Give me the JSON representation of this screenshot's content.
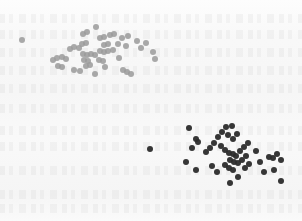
{
  "figure": {
    "background_color": "#f7f7f7",
    "width": 302,
    "height": 221,
    "has_axes": false,
    "has_gridlines": false,
    "has_border": false,
    "artifact_note": "faint illegible bleed-through text rows in background"
  },
  "chart_data": {
    "type": "scatter",
    "title": "",
    "subtitle": "",
    "xlabel": "",
    "ylabel": "",
    "xlim": [
      0,
      302
    ],
    "ylim": [
      221,
      0
    ],
    "grid": false,
    "legend": false,
    "legend_position": "none",
    "axis_ticks": false,
    "tick_labels": [],
    "annotations": [],
    "marker": "circle",
    "series": [
      {
        "name": "cluster-upper-left",
        "color": "#9a9a9a",
        "marker_size": 6,
        "opacity": 0.85,
        "count": 52,
        "centroid": [
          95,
          50
        ],
        "points": [
          [
            22,
            40
          ],
          [
            53,
            60
          ],
          [
            57,
            58
          ],
          [
            62,
            57
          ],
          [
            66,
            59
          ],
          [
            58,
            66
          ],
          [
            62,
            67
          ],
          [
            70,
            49
          ],
          [
            74,
            47
          ],
          [
            79,
            48
          ],
          [
            82,
            44
          ],
          [
            86,
            43
          ],
          [
            83,
            54
          ],
          [
            87,
            55
          ],
          [
            91,
            54
          ],
          [
            95,
            55
          ],
          [
            84,
            60
          ],
          [
            88,
            61
          ],
          [
            86,
            66
          ],
          [
            90,
            65
          ],
          [
            74,
            70
          ],
          [
            80,
            71
          ],
          [
            83,
            34
          ],
          [
            87,
            32
          ],
          [
            96,
            27
          ],
          [
            100,
            38
          ],
          [
            104,
            37
          ],
          [
            110,
            35
          ],
          [
            114,
            34
          ],
          [
            104,
            45
          ],
          [
            108,
            44
          ],
          [
            100,
            51
          ],
          [
            104,
            52
          ],
          [
            108,
            51
          ],
          [
            99,
            60
          ],
          [
            103,
            61
          ],
          [
            105,
            67
          ],
          [
            113,
            50
          ],
          [
            118,
            44
          ],
          [
            122,
            38
          ],
          [
            128,
            36
          ],
          [
            126,
            46
          ],
          [
            119,
            58
          ],
          [
            123,
            70
          ],
          [
            127,
            72
          ],
          [
            131,
            74
          ],
          [
            137,
            41
          ],
          [
            141,
            48
          ],
          [
            146,
            43
          ],
          [
            153,
            52
          ],
          [
            155,
            59
          ],
          [
            95,
            74
          ]
        ]
      },
      {
        "name": "cluster-lower-right",
        "color": "#2b2b2b",
        "marker_size": 6,
        "opacity": 0.95,
        "count": 48,
        "centroid": [
          232,
          155
        ],
        "points": [
          [
            150,
            149
          ],
          [
            189,
            128
          ],
          [
            192,
            148
          ],
          [
            196,
            139
          ],
          [
            198,
            142
          ],
          [
            186,
            162
          ],
          [
            196,
            170
          ],
          [
            206,
            152
          ],
          [
            210,
            148
          ],
          [
            214,
            143
          ],
          [
            218,
            137
          ],
          [
            222,
            132
          ],
          [
            226,
            127
          ],
          [
            232,
            126
          ],
          [
            228,
            135
          ],
          [
            233,
            139
          ],
          [
            237,
            134
          ],
          [
            221,
            146
          ],
          [
            225,
            150
          ],
          [
            229,
            153
          ],
          [
            233,
            154
          ],
          [
            236,
            156
          ],
          [
            240,
            151
          ],
          [
            244,
            147
          ],
          [
            248,
            143
          ],
          [
            230,
            160
          ],
          [
            234,
            162
          ],
          [
            238,
            163
          ],
          [
            242,
            160
          ],
          [
            246,
            156
          ],
          [
            225,
            165
          ],
          [
            229,
            168
          ],
          [
            233,
            170
          ],
          [
            245,
            168
          ],
          [
            249,
            164
          ],
          [
            238,
            177
          ],
          [
            230,
            183
          ],
          [
            217,
            172
          ],
          [
            212,
            166
          ],
          [
            256,
            151
          ],
          [
            260,
            162
          ],
          [
            264,
            172
          ],
          [
            269,
            157
          ],
          [
            273,
            158
          ],
          [
            277,
            154
          ],
          [
            281,
            160
          ],
          [
            274,
            170
          ],
          [
            281,
            181
          ]
        ]
      }
    ]
  }
}
